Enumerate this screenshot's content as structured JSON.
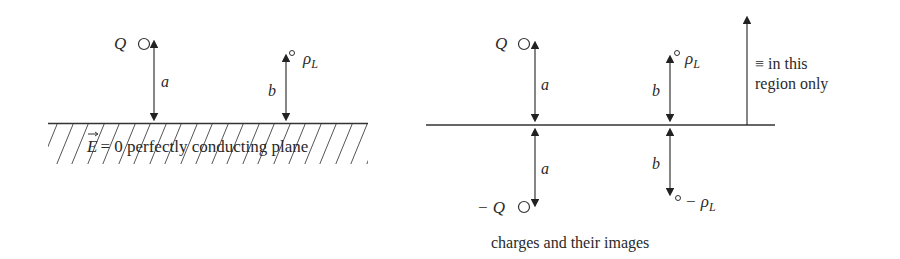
{
  "left_figure": {
    "charge_point": {
      "label": "Q",
      "distance_label": "a"
    },
    "line_charge": {
      "label": "ρ",
      "subscript": "L",
      "distance_label": "b"
    },
    "plane_label": "= 0 perfectly conducting plane",
    "field_symbol": "E"
  },
  "right_figure": {
    "charge_point": {
      "label": "Q",
      "distance_label": "a"
    },
    "image_charge_point": {
      "label": "− Q",
      "distance_label": "a"
    },
    "line_charge": {
      "label": "ρ",
      "subscript": "L",
      "distance_label": "b"
    },
    "image_line_charge": {
      "label": "− ρ",
      "subscript": "L",
      "distance_label": "b"
    },
    "equivalence_note_line1": "≡ in this",
    "equivalence_note_line2": "region only",
    "caption": "charges and their images"
  },
  "colors": {
    "ink": "#2a2a2a",
    "hatch": "#555555",
    "background": "#ffffff"
  }
}
